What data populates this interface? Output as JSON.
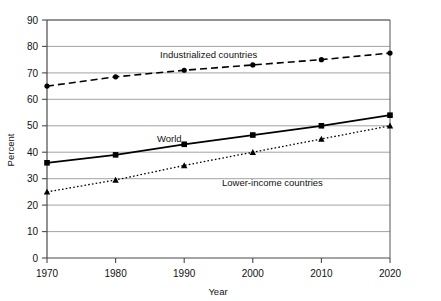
{
  "chart_data": {
    "type": "line",
    "title": "",
    "xlabel": "Year",
    "ylabel": "Percent",
    "x": [
      1970,
      1980,
      1990,
      2000,
      2010,
      2020
    ],
    "xtick_labels": [
      "1970",
      "1980",
      "1990",
      "2000",
      "2010",
      "2020"
    ],
    "ytick_labels": [
      "0",
      "10",
      "20",
      "30",
      "40",
      "50",
      "60",
      "70",
      "80",
      "90"
    ],
    "yticks": [
      0,
      10,
      20,
      30,
      40,
      50,
      60,
      70,
      80,
      90
    ],
    "xlim": [
      1970,
      2020
    ],
    "ylim": [
      0,
      90
    ],
    "grid": "horizontal",
    "legend_position": "inline-annotations",
    "series": [
      {
        "name": "Industrialized countries",
        "values": [
          65,
          68.5,
          71,
          73,
          75,
          77.5
        ],
        "style": "dashed",
        "marker": "circle",
        "color": "#000000",
        "label_x": 1996,
        "label_y": 79
      },
      {
        "name": "World",
        "values": [
          36,
          39,
          43,
          46.5,
          50,
          54
        ],
        "style": "solid",
        "marker": "square",
        "color": "#000000",
        "label_x": 1992,
        "label_y": 48
      },
      {
        "name": "Lower-income countries",
        "values": [
          25,
          29.5,
          35,
          40,
          45,
          50
        ],
        "style": "dotted",
        "marker": "triangle",
        "color": "#000000",
        "label_x": 2003,
        "label_y": 27.5
      }
    ]
  },
  "labels": {
    "y_axis_title": "Percent",
    "x_axis_title": "Year",
    "series_industrialized": "Industrialized countries",
    "series_world": "World",
    "series_lower_income": "Lower-income countries",
    "y_90": "90",
    "y_80": "80",
    "y_70": "70",
    "y_60": "60",
    "y_50": "50",
    "y_40": "40",
    "y_30": "30",
    "y_20": "20",
    "y_10": "10",
    "y_0": "0",
    "x_1970": "1970",
    "x_1980": "1980",
    "x_1990": "1990",
    "x_2000": "2000",
    "x_2010": "2010",
    "x_2020": "2020"
  }
}
